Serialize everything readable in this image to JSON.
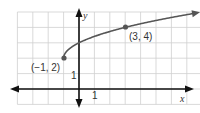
{
  "chart_data": {
    "type": "line",
    "title": "",
    "function": "y = sqrt(x + 1) + 2",
    "xlabel": "x",
    "ylabel": "y",
    "xlim": [
      -4,
      8
    ],
    "ylim": [
      -1,
      5
    ],
    "grid": true,
    "x_tick_label": "1",
    "y_tick_label": "1",
    "series": [
      {
        "name": "curve",
        "x": [
          -1,
          -0.75,
          0,
          1,
          2,
          3,
          4,
          5,
          6,
          7,
          7.9
        ],
        "y": [
          2,
          2.5,
          3,
          3.41,
          3.73,
          4,
          4.24,
          4.45,
          4.65,
          4.83,
          4.98
        ],
        "color": "#555555",
        "end_arrow": true
      }
    ],
    "points": [
      {
        "x": -1,
        "y": 2,
        "label": "(−1, 2)"
      },
      {
        "x": 3,
        "y": 4,
        "label": "(3, 4)"
      }
    ]
  },
  "labels": {
    "x_axis": "x",
    "y_axis": "y",
    "x_unit": "1",
    "y_unit": "1",
    "point_a": "(−1, 2)",
    "point_b": "(3, 4)"
  }
}
